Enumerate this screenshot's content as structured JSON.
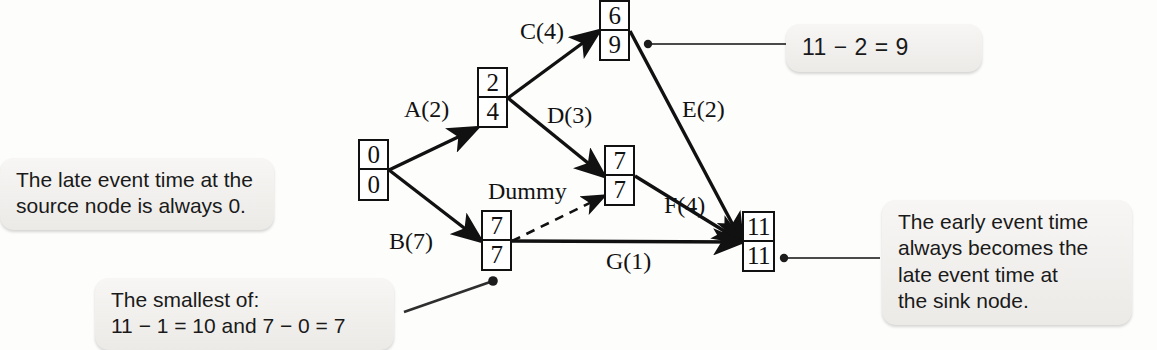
{
  "diagram": {
    "nodes": [
      {
        "id": "source",
        "early": "0",
        "late": "0",
        "x": 358,
        "y": 139,
        "w": 31,
        "h": 62
      },
      {
        "id": "n2",
        "early": "2",
        "late": "4",
        "x": 477,
        "y": 67,
        "w": 31,
        "h": 61
      },
      {
        "id": "n3",
        "early": "6",
        "late": "9",
        "x": 599,
        "y": 0,
        "w": 31,
        "h": 61
      },
      {
        "id": "n4",
        "early": "7",
        "late": "7",
        "x": 604,
        "y": 145,
        "w": 31,
        "h": 61
      },
      {
        "id": "n5",
        "early": "7",
        "late": "7",
        "x": 481,
        "y": 210,
        "w": 31,
        "h": 61
      },
      {
        "id": "sink",
        "early": "11",
        "late": "11",
        "x": 742,
        "y": 211,
        "w": 33,
        "h": 61
      }
    ],
    "activities": [
      {
        "name": "A(2)",
        "label_x": 404,
        "label_y": 96,
        "style": "solid"
      },
      {
        "name": "C(4)",
        "label_x": 520,
        "label_y": 18,
        "style": "solid"
      },
      {
        "name": "D(3)",
        "label_x": 547,
        "label_y": 102,
        "style": "solid"
      },
      {
        "name": "E(2)",
        "label_x": 682,
        "label_y": 96,
        "style": "solid"
      },
      {
        "name": "B(7)",
        "label_x": 389,
        "label_y": 228,
        "style": "solid"
      },
      {
        "name": "F(4)",
        "label_x": 664,
        "label_y": 192,
        "style": "solid"
      },
      {
        "name": "G(1)",
        "label_x": 606,
        "label_y": 248,
        "style": "solid"
      },
      {
        "name": "Dummy",
        "label_x": 488,
        "label_y": 178,
        "style": "dashed"
      }
    ],
    "callouts": [
      {
        "id": "source-late-time",
        "lines": [
          "The late event time at the",
          "source node is always 0."
        ],
        "x": 0,
        "y": 158,
        "w": 274,
        "h": 64
      },
      {
        "id": "smallest-of",
        "lines": [
          "The smallest of:",
          "11 − 1 = 10 and 7 − 0 = 7"
        ],
        "x": 95,
        "y": 278,
        "w": 299,
        "h": 66
      },
      {
        "id": "late-time-calc",
        "lines": [
          "11 − 2 = 9"
        ],
        "x": 786,
        "y": 24,
        "w": 196,
        "h": 41
      },
      {
        "id": "sink-event-time",
        "lines": [
          "The early event time",
          "always becomes the",
          "late event time at",
          "the sink node."
        ],
        "x": 882,
        "y": 200,
        "w": 250,
        "h": 122
      }
    ],
    "leaders": [
      {
        "id": "leader-to-node3",
        "dot_x": 648,
        "dot_y": 44,
        "end_x": 786,
        "end_y": 44
      },
      {
        "id": "leader-to-sink",
        "dot_x": 784,
        "dot_y": 258,
        "end_x": 880,
        "end_y": 258
      },
      {
        "id": "leader-to-node5",
        "dot_x": 493,
        "dot_y": 281,
        "end_x": 408,
        "end_y": 310
      }
    ],
    "colors": {
      "stroke": "#111111",
      "leader": "#3a3a3a",
      "callout_bg": "#f2f1ef",
      "page_bg": "#fdfdfc"
    }
  }
}
